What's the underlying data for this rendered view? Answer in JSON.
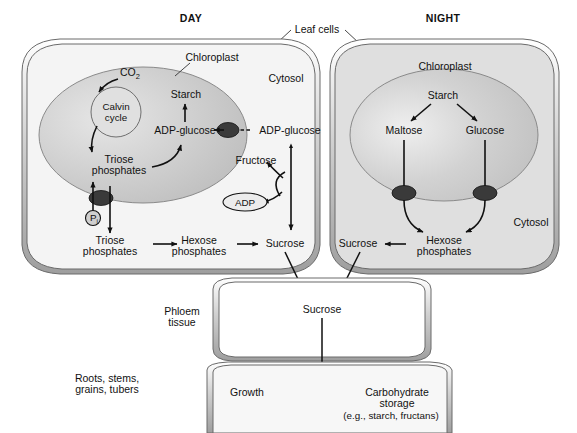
{
  "figure": {
    "title_day": "DAY",
    "title_night": "NIGHT",
    "leaf_cells_label": "Leaf cells"
  },
  "day_cell": {
    "compartments": {
      "chloroplast": "Chloroplast",
      "cytosol": "Cytosol"
    },
    "nodes": {
      "co2": "CO",
      "co2_sub": "2",
      "calvin_1": "Calvin",
      "calvin_2": "cycle",
      "starch": "Starch",
      "adp_glucose_in": "ADP-glucose",
      "adp_glucose_out": "ADP-glucose",
      "triose_in_1": "Triose",
      "triose_in_2": "phosphates",
      "triose_out_1": "Triose",
      "triose_out_2": "phosphates",
      "pi": "P",
      "pi_sub": "i",
      "fructose": "Fructose",
      "adp": "ADP",
      "hexose_1": "Hexose",
      "hexose_2": "phosphates",
      "sucrose": "Sucrose"
    }
  },
  "night_cell": {
    "compartments": {
      "chloroplast": "Chloroplast",
      "cytosol": "Cytosol"
    },
    "nodes": {
      "starch": "Starch",
      "maltose": "Maltose",
      "glucose": "Glucose",
      "hexose_1": "Hexose",
      "hexose_2": "phosphates",
      "sucrose": "Sucrose"
    }
  },
  "phloem": {
    "label_1": "Phloem",
    "label_2": "tissue",
    "sucrose": "Sucrose"
  },
  "sink": {
    "label_1": "Roots, stems,",
    "label_2": "grains, tubers",
    "growth": "Growth",
    "storage_1": "Carbohydrate",
    "storage_2": "storage",
    "storage_3": "(e.g., starch, fructans)"
  },
  "colors": {
    "ink": "#111111",
    "outline": "#555555",
    "membrane_fill": "#d8d8d8",
    "day_cytosol": "#f2f2f2",
    "night_cytosol": "#dcdcdc",
    "chloroplast_day": "#c9c9c9",
    "chloroplast_night": "#c4c4c4",
    "calvin_fill": "#e2e2e2",
    "transporter": "#2b2b2b",
    "phloem_fill": "#ffffff"
  }
}
